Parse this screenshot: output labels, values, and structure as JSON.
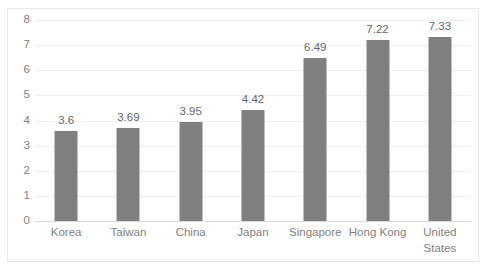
{
  "chart_data": {
    "type": "bar",
    "title": "",
    "subtitle": "",
    "xlabel": "",
    "ylabel": "",
    "categories": [
      "Korea",
      "Taiwan",
      "China",
      "Japan",
      "Singapore",
      "Hong Kong",
      "United States"
    ],
    "values": [
      3.6,
      3.69,
      3.95,
      4.42,
      6.49,
      7.22,
      7.33
    ],
    "data_labels": [
      "3.6",
      "3.69",
      "3.95",
      "4.42",
      "6.49",
      "7.22",
      "7.33"
    ],
    "ylim": [
      0,
      8
    ],
    "y_ticks": [
      0,
      1,
      2,
      3,
      4,
      5,
      6,
      7,
      8
    ],
    "y_tick_labels": [
      "0",
      "1",
      "2",
      "3",
      "4",
      "5",
      "6",
      "7",
      "8"
    ],
    "grid": true,
    "grid_axis": "y",
    "legend": false,
    "legend_position": "none",
    "series": [
      {
        "name": "",
        "values": [
          3.6,
          3.69,
          3.95,
          4.42,
          6.49,
          7.22,
          7.33
        ]
      }
    ],
    "colors": {
      "bar": "#808080",
      "gridline": "#efefef",
      "axis_line": "#d9d9d9",
      "tick_label": "#808080",
      "data_label": "#666666",
      "border": "#e8e8e8",
      "background": "#ffffff"
    }
  }
}
